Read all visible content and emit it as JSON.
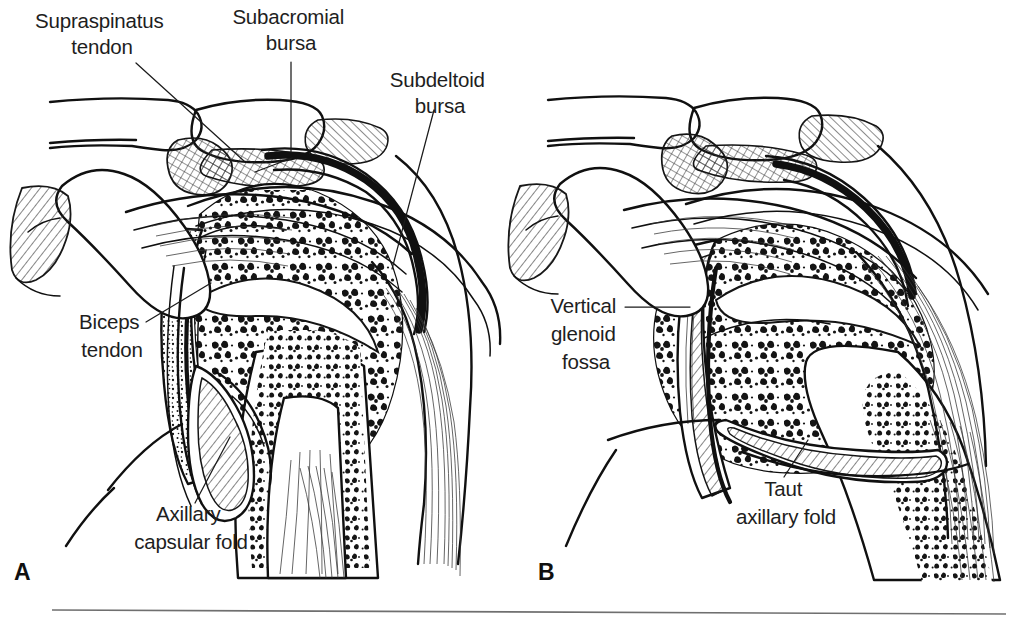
{
  "figure": {
    "type": "anatomical-line-illustration",
    "background_color": "#ffffff",
    "ink_color": "#101010",
    "width": 1021,
    "height": 626
  },
  "panels": [
    {
      "id": "A",
      "letter": "A",
      "letter_x": 14,
      "letter_y": 580,
      "description": "Arm at side: lax axillary capsular fold"
    },
    {
      "id": "B",
      "letter": "B",
      "letter_x": 538,
      "letter_y": 580,
      "description": "Arm abducted: taut axillary fold"
    }
  ],
  "labels": [
    {
      "id": "supraspinatus-tendon",
      "lines": [
        "Supraspinatus",
        "tendon"
      ],
      "x": 102,
      "y": 28,
      "anchor": "middle",
      "line_height": 26,
      "panel": "A"
    },
    {
      "id": "subacromial-bursa",
      "lines": [
        "Subacromial",
        "bursa"
      ],
      "x": 291,
      "y": 24,
      "anchor": "middle",
      "line_height": 26,
      "panel": "A"
    },
    {
      "id": "subdeltoid-bursa",
      "lines": [
        "Subdeltoid",
        "bursa"
      ],
      "x": 440,
      "y": 87,
      "anchor": "middle",
      "line_height": 26,
      "panel": "A"
    },
    {
      "id": "biceps-tendon",
      "lines": [
        "Biceps",
        "tendon"
      ],
      "x": 112,
      "y": 329,
      "anchor": "middle",
      "line_height": 28,
      "panel": "A"
    },
    {
      "id": "axillary-capsular-fold",
      "lines": [
        "Axillary",
        "capsular fold"
      ],
      "x": 191,
      "y": 521,
      "anchor": "middle",
      "line_height": 28,
      "panel": "A"
    },
    {
      "id": "vertical-glenoid-fossa",
      "lines": [
        "Vertical",
        "glenoid",
        "fossa"
      ],
      "x": 586,
      "y": 313,
      "anchor": "middle",
      "line_height": 28,
      "panel": "B"
    },
    {
      "id": "taut-axillary-fold",
      "lines": [
        "Taut",
        "axillary fold"
      ],
      "x": 786,
      "y": 496,
      "anchor": "middle",
      "line_height": 28,
      "panel": "B"
    }
  ],
  "leader_lines": [
    {
      "id": "leader-supraspinatus-tendon",
      "path": "M 136 63 L 244 161"
    },
    {
      "id": "leader-subacromial-bursa",
      "path": "M 291 62 L 291 152"
    },
    {
      "id": "leader-subdeltoid-bursa",
      "path": "M 434 110 L 392 269"
    },
    {
      "id": "leader-biceps-tendon",
      "path": "M 146 322 L 211 283"
    },
    {
      "id": "leader-axillary-capsular-fold",
      "path": "M 195 503 L 230 437"
    },
    {
      "id": "leader-vertical-glenoid-fossa",
      "path": "M 625 307 L 690 307"
    },
    {
      "id": "leader-taut-axillary-fold",
      "path": "M 784 477 L 808 440"
    }
  ],
  "footer_rule": {
    "id": "footer-rule",
    "x1": 52,
    "y1": 610,
    "x2": 1006,
    "y2": 614,
    "color": "#6f6f6f"
  }
}
